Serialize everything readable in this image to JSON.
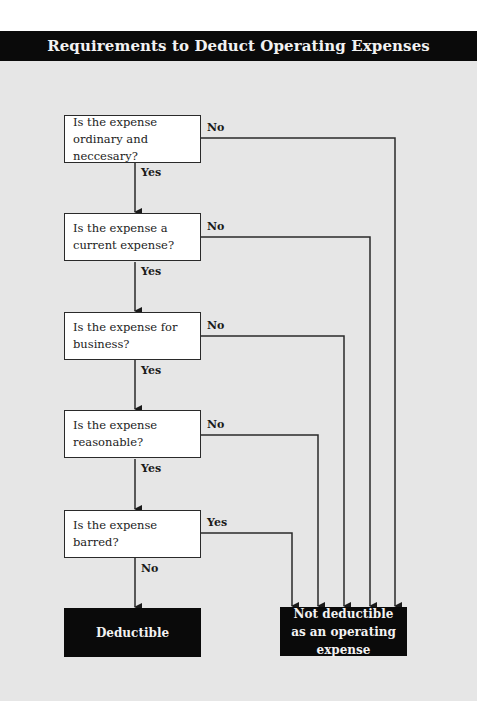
{
  "title": "Requirements to Deduct Operating Expenses",
  "questions": [
    {
      "text": "Is the expense ordinary and neccesary?",
      "pass_label": "Yes",
      "fail_label": "No"
    },
    {
      "text": "Is the expense a current expense?",
      "pass_label": "Yes",
      "fail_label": "No"
    },
    {
      "text": "Is the expense for business?",
      "pass_label": "Yes",
      "fail_label": "No"
    },
    {
      "text": "Is the expense reasonable?",
      "pass_label": "Yes",
      "fail_label": "No"
    },
    {
      "text": "Is the expense barred?",
      "pass_label": "No",
      "fail_label": "Yes"
    }
  ],
  "outcomes": {
    "deductible": "Deductible",
    "not_deductible": "Not deductible as an operating expense"
  },
  "colors": {
    "panel": "#e6e6e6",
    "header": "#0a0a0a",
    "line": "#2a2a2a"
  }
}
